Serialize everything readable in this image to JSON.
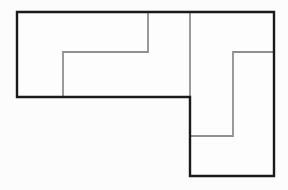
{
  "figure": {
    "kind": "floor-plan-outline",
    "background_color": "#fcfcfd",
    "width": 288,
    "height": 190,
    "title_text": "",
    "has_labels": false,
    "has_text": false
  },
  "colors": {
    "outer_wall": "#1a1a1a",
    "inner_wall": "#909090",
    "floor": "#fdfdfd",
    "background": "#fcfcfd"
  },
  "strokes": {
    "outer_wall_width": 2.4,
    "inner_wall_width": 1.8
  },
  "shapes": {
    "outer_outline": {
      "name": "outer-wall-L-shape",
      "closed": true,
      "points": "17,12 274,12 274,176 190,176 190,97 17,97",
      "vertices": [
        [
          17,
          12
        ],
        [
          274,
          12
        ],
        [
          274,
          176
        ],
        [
          190,
          176
        ],
        [
          190,
          97
        ],
        [
          17,
          97
        ]
      ]
    },
    "floor_region": {
      "name": "floor-area",
      "points": "17,12 274,12 274,176 190,176 190,97 17,97"
    },
    "inner_walls": [
      {
        "name": "inner-wall-center-divider",
        "points": "190,12 190,97",
        "orientation": "vertical"
      },
      {
        "name": "inner-wall-left-room-partition",
        "points": "63,97 63,52 148,52 148,12",
        "orientation": "polyline"
      },
      {
        "name": "inner-wall-right-room-partition",
        "points": "274,52 233,52 233,136 190,136",
        "orientation": "polyline"
      }
    ]
  }
}
